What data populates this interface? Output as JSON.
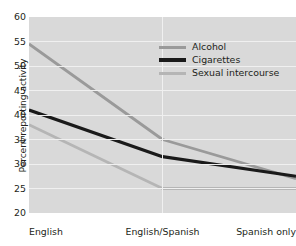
{
  "chart_data": {
    "type": "line",
    "title": "",
    "xlabel": "",
    "ylabel": "Percent reporting activity",
    "categories": [
      "English",
      "English/Spanish",
      "Spanish only"
    ],
    "ylim": [
      20,
      60
    ],
    "yticks": [
      20,
      25,
      30,
      35,
      40,
      45,
      50,
      55,
      60
    ],
    "grid": true,
    "legend_position": "top-center",
    "series": [
      {
        "name": "Alcohol",
        "color": "#9a9a9a",
        "values": [
          54.5,
          35.0,
          27.0
        ]
      },
      {
        "name": "Cigarettes",
        "color": "#1a1a1a",
        "values": [
          41.0,
          31.5,
          27.5
        ]
      },
      {
        "name": "Sexual intercourse",
        "color": "#b5b5b5",
        "values": [
          38.0,
          25.0,
          25.0
        ]
      }
    ]
  },
  "colors": {
    "plot_background": "#d9d9d9",
    "gridline": "#f0f0f0",
    "text": "#231f20",
    "page_background": "#ffffff"
  }
}
